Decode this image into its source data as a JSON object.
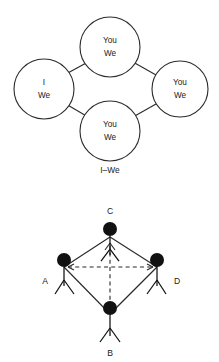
{
  "diagram_top": {
    "caption": "I–We",
    "nodes": [
      {
        "id": "left",
        "line1": "I",
        "line2": "We",
        "cx": 44,
        "cy": 89,
        "r": 30
      },
      {
        "id": "top",
        "line1": "You",
        "line2": "We",
        "cx": 110,
        "cy": 47,
        "r": 30
      },
      {
        "id": "right",
        "line1": "You",
        "line2": "We",
        "cx": 180,
        "cy": 89,
        "r": 28
      },
      {
        "id": "bottom",
        "line1": "You",
        "line2": "We",
        "cx": 110,
        "cy": 131,
        "r": 30
      }
    ],
    "edges": [
      {
        "from": "left",
        "to": "top"
      },
      {
        "from": "top",
        "to": "right"
      },
      {
        "from": "left",
        "to": "bottom"
      },
      {
        "from": "bottom",
        "to": "right"
      }
    ]
  },
  "diagram_bottom": {
    "figures": [
      {
        "id": "C",
        "label": "C",
        "hx": 110,
        "hy": 48,
        "label_x": 110,
        "label_y": 30,
        "label_pos": "above"
      },
      {
        "id": "A",
        "label": "A",
        "hx": 64,
        "hy": 79,
        "label_x": 45,
        "label_y": 100,
        "label_pos": "left"
      },
      {
        "id": "D",
        "label": "D",
        "hx": 157,
        "hy": 79,
        "label_x": 177,
        "label_y": 100,
        "label_pos": "right"
      },
      {
        "id": "B",
        "label": "B",
        "hx": 110,
        "hy": 127,
        "label_x": 110,
        "label_y": 172,
        "label_pos": "below"
      }
    ],
    "solid_edges": [
      {
        "from": "A",
        "to": "C"
      },
      {
        "from": "C",
        "to": "D"
      },
      {
        "from": "A",
        "to": "B"
      },
      {
        "from": "B",
        "to": "D"
      }
    ],
    "dashed_edges": [
      {
        "from": "A",
        "to": "D",
        "arrows": "both"
      },
      {
        "from": "B",
        "to": "C",
        "arrows": "up"
      }
    ]
  },
  "style": {
    "background": "#ffffff",
    "stroke": "#2b2b2b",
    "head_fill": "#111111",
    "text": "#1a1a1a"
  }
}
